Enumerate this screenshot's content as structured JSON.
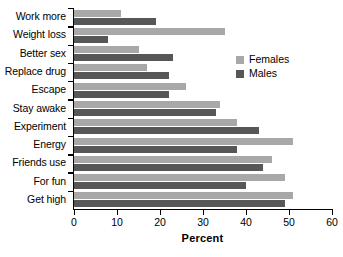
{
  "chart_data": {
    "type": "bar",
    "orientation": "horizontal",
    "title": "",
    "xlabel": "Percent",
    "ylabel": "",
    "xlim": [
      0,
      60
    ],
    "xticks": [
      0,
      10,
      20,
      30,
      40,
      50,
      60
    ],
    "grid": false,
    "legend_position": "upper right",
    "categories": [
      "Work more",
      "Weight loss",
      "Better sex",
      "Replace drug",
      "Escape",
      "Stay awake",
      "Experiment",
      "Energy",
      "Friends use",
      "For fun",
      "Get high"
    ],
    "series": [
      {
        "name": "Females",
        "color": "#a8a8a8",
        "values": [
          11,
          35,
          15,
          17,
          26,
          34,
          38,
          51,
          46,
          49,
          51
        ]
      },
      {
        "name": "Males",
        "color": "#575757",
        "values": [
          19,
          8,
          23,
          22,
          22,
          33,
          43,
          38,
          44,
          40,
          49
        ]
      }
    ]
  },
  "legend": {
    "items": [
      {
        "label": "Females",
        "color": "#a8a8a8"
      },
      {
        "label": "Males",
        "color": "#575757"
      }
    ]
  }
}
